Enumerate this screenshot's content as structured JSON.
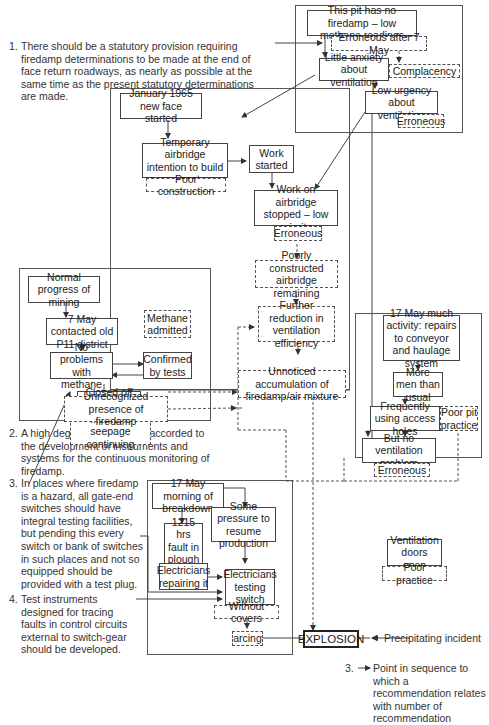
{
  "recommendations": [
    {
      "num": "1.",
      "text": "There should be a statutory provision requiring firedamp determinations to be made at the end of face return roadways, as nearly as possible at the same time as the present statutory determinations are made."
    },
    {
      "num": "2.",
      "text": "A high degree of priority be accorded to the development of instruments and systems for the continuous monitoring of firedamp."
    },
    {
      "num": "3.",
      "text": "In places where firedamp is a hazard, all gate-end switches should have integral testing facilities, but pending this every switch or bank of switches in such places and not so equipped should be provided with a test plug."
    },
    {
      "num": "4.",
      "text": "Test instruments designed for tracing faults in control circuits external to switch-gear should be developed."
    }
  ],
  "nodes": {
    "no_firedamp": "This pit has no firedamp – low methane readings",
    "erroneous_after_7may": "Erroneous after 7 May",
    "little_anxiety": "Little anxiety about ventilation",
    "complacency": "Complacency",
    "low_urgency": "Low urgency about ventilation",
    "erroneous_1": "Erroneous",
    "jan1965": "January 1965 new face started",
    "temp_airbridge": "Temporary airbridge intention to build permanent one",
    "poor_construction": "Poor construction",
    "work_started": "Work started",
    "work_stopped": "Work on airbridge stopped – low priority",
    "erroneous_2": "Erroneous",
    "poorly_constructed": "Poorly constructed airbridge remaining",
    "further_reduction": "Further reduction in ventilation efficiency",
    "unnoticed_accumulation": "Unnoticed accumulation of firedamp/air mixture",
    "normal_progress": "Normal progress of mining",
    "may7_contacted": "7 May contacted old P11 district",
    "methane_admitted": "Methane admitted",
    "no_problems": "No problems with methane",
    "confirmed_tests": "Confirmed by tests",
    "closed_off": "Closed off as a precaution",
    "methane_seepage": "Methane seepage continuing",
    "unrecognized_presence": "Unrecognized presence of firedamp",
    "may17_activity": "17 May much activity: repairs to conveyor and haulage system",
    "more_men": "More men than usual",
    "frequently_using": "Frequently using access holes",
    "poor_pit_practice": "Poor pit practice",
    "no_vent_problem": "But no ventilation problem",
    "erroneous_3": "Erroneous",
    "may17_breakdown": "17 May morning of breakdown",
    "fault_1215": "1215 hrs fault in plough motor",
    "some_pressure": "Some pressure to resume production",
    "elec_repairing": "Electricians repairing it",
    "elec_testing": "Electricians testing switch",
    "without_covers": "Without covers",
    "arcing": "arcing",
    "explosion": "EXPLOSION",
    "vent_doors": "Ventilation doors open",
    "poor_practice": "Poor practice"
  },
  "legend": {
    "precipitating": "Precipitating incident",
    "point_num": "3.",
    "point_text": "Point in sequence to which a recommendation relates with number of recommendation"
  },
  "colors": {
    "line": "#444444",
    "background": "#ffffff"
  }
}
